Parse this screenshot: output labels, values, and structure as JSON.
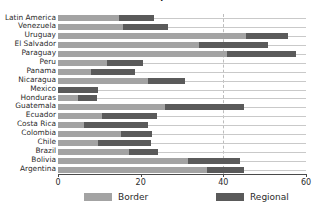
{
  "chart_data": {
    "type": "bar",
    "orientation": "horizontal",
    "stacked": true,
    "title": "of Exports",
    "xlabel": "",
    "ylabel": "",
    "xlim": [
      0,
      60
    ],
    "xticks": [
      0,
      20,
      40,
      60
    ],
    "xtick_labels": [
      "0",
      "20",
      "40",
      "60"
    ],
    "gridlines": [
      40
    ],
    "grid": "dashed vertical at 40",
    "legend_position": "bottom",
    "categories": [
      "Latin America",
      "Venezuela",
      "Uruguay",
      "El Salvador",
      "Paraguay",
      "Peru",
      "Panama",
      "Nicaragua",
      "Mexico",
      "Honduras",
      "Guatemala",
      "Ecuador",
      "Costa Rica",
      "Colombia",
      "Chile",
      "Brazil",
      "Bolivia",
      "Argentina"
    ],
    "series": [
      {
        "name": "Border",
        "color": "#a3a3a3",
        "values": [
          14.8,
          15.8,
          45.5,
          34.1,
          40.9,
          11.9,
          8.0,
          21.8,
          0.0,
          4.8,
          25.9,
          10.6,
          6.3,
          15.3,
          9.7,
          17.2,
          31.5,
          36.1
        ]
      },
      {
        "name": "Regional",
        "color": "#5a5a5a",
        "values": [
          8.4,
          10.8,
          10.2,
          16.8,
          16.6,
          8.7,
          10.6,
          9.0,
          9.6,
          4.6,
          19.1,
          13.4,
          15.5,
          7.5,
          12.8,
          7.0,
          12.5,
          9.0
        ]
      }
    ],
    "totals": [
      23.2,
      26.6,
      55.7,
      50.9,
      57.5,
      20.6,
      18.6,
      30.8,
      9.6,
      9.4,
      45.0,
      24.0,
      21.8,
      22.8,
      22.5,
      24.2,
      44.0,
      45.1
    ]
  },
  "legend": {
    "items": [
      {
        "label": "Border",
        "color": "#a3a3a3"
      },
      {
        "label": "Regional",
        "color": "#5a5a5a"
      }
    ]
  },
  "colors": {
    "border": "#a3a3a3",
    "regional": "#5a5a5a",
    "axis": "#4a4a4a",
    "grid": "#bdbdbd",
    "rowline": "#c9c9c9",
    "text": "#2b2b2b",
    "background": "#ffffff"
  }
}
